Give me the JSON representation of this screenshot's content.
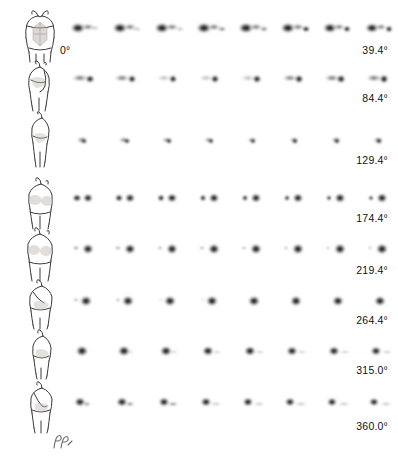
{
  "figure": {
    "modality": "nuclear-medicine-planar-rotation",
    "rows_count": 8,
    "columns_count": 8,
    "start_angle_label": "0°",
    "corner_mark_name": "hand-drawn-initials-mark",
    "clipped_caption_text": ""
  },
  "rows": [
    {
      "id": "row-0",
      "angle_label": "39.4°",
      "start_label": "0°",
      "body_view": "anterior",
      "body_view_label": "anterior torso with shaded abdominal field",
      "blob_shape": "wide-horizontal-double-lobe",
      "top": 8,
      "frames": [
        {
          "index": 1,
          "intensity": 0.78
        },
        {
          "index": 2,
          "intensity": 0.8
        },
        {
          "index": 3,
          "intensity": 0.82
        },
        {
          "index": 4,
          "intensity": 0.84
        },
        {
          "index": 5,
          "intensity": 0.86
        },
        {
          "index": 6,
          "intensity": 0.88
        },
        {
          "index": 7,
          "intensity": 0.9
        },
        {
          "index": 8,
          "intensity": 0.92
        }
      ]
    },
    {
      "id": "row-1",
      "angle_label": "84.4°",
      "body_view": "right-lateral",
      "body_view_label": "right lateral torso with arm raised",
      "blob_shape": "elongated-with-dark-tail",
      "top": 58,
      "frames": [
        {
          "index": 1,
          "intensity": 0.8
        },
        {
          "index": 2,
          "intensity": 0.78
        },
        {
          "index": 3,
          "intensity": 0.76
        },
        {
          "index": 4,
          "intensity": 0.78
        },
        {
          "index": 5,
          "intensity": 0.8
        },
        {
          "index": 6,
          "intensity": 0.82
        },
        {
          "index": 7,
          "intensity": 0.84
        },
        {
          "index": 8,
          "intensity": 0.86
        }
      ]
    },
    {
      "id": "row-2",
      "angle_label": "129.4°",
      "body_view": "posterior-oblique-right",
      "body_view_label": "right posterior oblique torso",
      "blob_shape": "small-compact-dark-core",
      "top": 106,
      "frames": [
        {
          "index": 1,
          "intensity": 0.72
        },
        {
          "index": 2,
          "intensity": 0.74
        },
        {
          "index": 3,
          "intensity": 0.76
        },
        {
          "index": 4,
          "intensity": 0.78
        },
        {
          "index": 5,
          "intensity": 0.8
        },
        {
          "index": 6,
          "intensity": 0.82
        },
        {
          "index": 7,
          "intensity": 0.84
        },
        {
          "index": 8,
          "intensity": 0.86
        }
      ]
    },
    {
      "id": "row-3",
      "angle_label": "174.4°",
      "body_view": "posterior",
      "body_view_label": "posterior torso with shaded renal fields",
      "blob_shape": "paired-kidney-lobes",
      "top": 176,
      "frames": [
        {
          "index": 1,
          "intensity": 0.86
        },
        {
          "index": 2,
          "intensity": 0.88
        },
        {
          "index": 3,
          "intensity": 0.88
        },
        {
          "index": 4,
          "intensity": 0.9
        },
        {
          "index": 5,
          "intensity": 0.9
        },
        {
          "index": 6,
          "intensity": 0.9
        },
        {
          "index": 7,
          "intensity": 0.92
        },
        {
          "index": 8,
          "intensity": 0.92
        }
      ]
    },
    {
      "id": "row-4",
      "angle_label": "219.4°",
      "body_view": "posterior-breast",
      "body_view_label": "posterior torso, shaded upper fields",
      "blob_shape": "small-left-dot-plus-large-right-lobe",
      "top": 226,
      "frames": [
        {
          "index": 1,
          "intensity": 0.88
        },
        {
          "index": 2,
          "intensity": 0.88
        },
        {
          "index": 3,
          "intensity": 0.9
        },
        {
          "index": 4,
          "intensity": 0.9
        },
        {
          "index": 5,
          "intensity": 0.92
        },
        {
          "index": 6,
          "intensity": 0.92
        },
        {
          "index": 7,
          "intensity": 0.92
        },
        {
          "index": 8,
          "intensity": 0.94
        }
      ]
    },
    {
      "id": "row-5",
      "angle_label": "264.4°",
      "body_view": "left-posterior-oblique",
      "body_view_label": "left posterior oblique torso",
      "blob_shape": "rounded-dense-mass",
      "top": 278,
      "frames": [
        {
          "index": 1,
          "intensity": 0.92
        },
        {
          "index": 2,
          "intensity": 0.92
        },
        {
          "index": 3,
          "intensity": 0.92
        },
        {
          "index": 4,
          "intensity": 0.92
        },
        {
          "index": 5,
          "intensity": 0.92
        },
        {
          "index": 6,
          "intensity": 0.92
        },
        {
          "index": 7,
          "intensity": 0.92
        },
        {
          "index": 8,
          "intensity": 0.92
        }
      ]
    },
    {
      "id": "row-6",
      "angle_label": "315.0°",
      "body_view": "left-lateral",
      "body_view_label": "left lateral torso",
      "blob_shape": "round-dense-with-faint-tail",
      "top": 328,
      "frames": [
        {
          "index": 1,
          "intensity": 0.94
        },
        {
          "index": 2,
          "intensity": 0.94
        },
        {
          "index": 3,
          "intensity": 0.93
        },
        {
          "index": 4,
          "intensity": 0.92
        },
        {
          "index": 5,
          "intensity": 0.92
        },
        {
          "index": 6,
          "intensity": 0.91
        },
        {
          "index": 7,
          "intensity": 0.9
        },
        {
          "index": 8,
          "intensity": 0.9
        }
      ]
    },
    {
      "id": "row-7",
      "angle_label": "360.0°",
      "body_view": "anterior-oblique",
      "body_view_label": "left anterior oblique torso with arm",
      "blob_shape": "dense-head-with-trailing-tail",
      "top": 380,
      "frames": [
        {
          "index": 1,
          "intensity": 0.9
        },
        {
          "index": 2,
          "intensity": 0.9
        },
        {
          "index": 3,
          "intensity": 0.9
        },
        {
          "index": 4,
          "intensity": 0.89
        },
        {
          "index": 5,
          "intensity": 0.89
        },
        {
          "index": 6,
          "intensity": 0.88
        },
        {
          "index": 7,
          "intensity": 0.88
        },
        {
          "index": 8,
          "intensity": 0.88
        }
      ]
    }
  ],
  "colors": {
    "background": "#ffffff",
    "blob_core": "#111111",
    "blob_mid": "#555555",
    "blob_edge": "#bdbdbd",
    "outline": "#3a3a3a",
    "shade": "#b9b3ad",
    "label_text": "#111111"
  }
}
